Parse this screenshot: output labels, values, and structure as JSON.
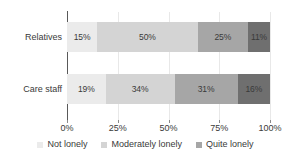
{
  "chart_data": {
    "type": "bar",
    "orientation": "horizontal",
    "stacked": true,
    "normalized": "100%",
    "title": "",
    "subtitle": "",
    "xlabel": "",
    "ylabel": "",
    "xlim": [
      0,
      100
    ],
    "xticks": [
      0,
      25,
      50,
      75,
      100
    ],
    "xtick_labels": [
      "0%",
      "25%",
      "50%",
      "75%",
      "100%"
    ],
    "grid": "vertical",
    "legend_position": "bottom",
    "categories": [
      "Relatives",
      "Care staff"
    ],
    "series": [
      {
        "name": "Not lonely",
        "color": "#ebebeb",
        "values": [
          15,
          19
        ],
        "labels": [
          "15%",
          "19%"
        ]
      },
      {
        "name": "Moderately lonely",
        "color": "#d4d4d4",
        "values": [
          50,
          34
        ],
        "labels": [
          "50%",
          "34%"
        ]
      },
      {
        "name": "Quite lonely",
        "color": "#a6a6a6",
        "values": [
          25,
          31
        ],
        "labels": [
          "25%",
          "31%"
        ]
      },
      {
        "name": "",
        "color": "#6f6f6f",
        "values": [
          11,
          16
        ],
        "labels": [
          "11%",
          "16%"
        ]
      }
    ],
    "legend_entries": [
      {
        "label": "Not lonely",
        "color": "#ebebeb"
      },
      {
        "label": "Moderately lonely",
        "color": "#d4d4d4"
      },
      {
        "label": "Quite lonely",
        "color": "#a6a6a6"
      }
    ],
    "axis_color": "#595959",
    "gridline_color": "#e8e8e8",
    "text_color": "#3a3a3a"
  }
}
